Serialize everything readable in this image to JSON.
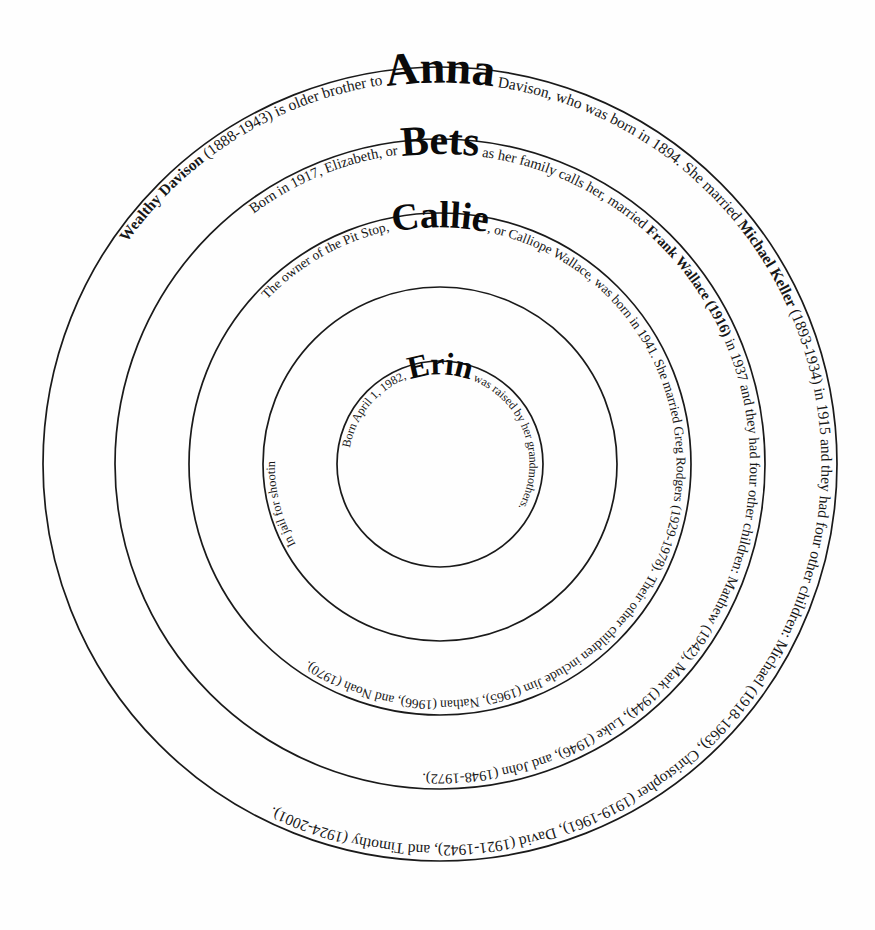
{
  "diagram": {
    "type": "concentric-rings",
    "background_color": "#ffffff",
    "stroke_color": "#1a1a1a",
    "text_color": "#171717"
  },
  "rings": [
    {
      "id": "ring-anna",
      "name": "Anna",
      "generation": 1,
      "radius": 397,
      "name_font_size": 46,
      "body_font_size": 15.5,
      "lead_text": "Wealthy Davison ",
      "lead_text_plain": "(1888-1943) is older brother to ",
      "trail_text": " Davison, who was born in 1894. She married ",
      "trail_bold_1": "Michael Keller",
      "trail_text_2": " (1893-1934) in 1915 and they had four other children: Michael (1918-1963), Christopher (1919-1961), David (1921-1942), and Timothy (1924-2001).",
      "full_text": "Wealthy Davison (1888-1943) is older brother to Anna Davison, who was born in 1894. She married Michael Keller (1893-1934) in 1915 and they had four other children: Michael (1918-1963), Christopher (1919-1961), David (1921-1942), and Timothy (1924-2001)."
    },
    {
      "id": "ring-bets",
      "name": "Bets",
      "generation": 2,
      "radius": 325,
      "name_font_size": 42,
      "body_font_size": 14.5,
      "lead_text_plain": "Born in 1917, Elizabeth, or ",
      "trail_text": " as her family calls her, married ",
      "trail_bold_1": "Frank Wallace (1916)",
      "trail_text_2": " in 1937 and they had four other children: Matthew (1942), Mark (1944), Luke (1946), and John (1948-1972).",
      "full_text": "Born in 1917, Elizabeth, or Bets as her family calls her, married Frank Wallace (1916) in 1937 and they had four other children: Matthew (1942), Mark (1944), Luke (1946), and John (1948-1972)."
    },
    {
      "id": "ring-callie",
      "name": "Callie",
      "generation": 3,
      "radius": 251,
      "name_font_size": 38,
      "body_font_size": 13.5,
      "lead_text_plain": "The owner of the Pit Stop, ",
      "trail_text": ", or Calliope Wallace, was born in 1941. She married Greg Rodgers (1929-1978). Their other children include Jim (1965), Nathan (1966), and Noah (1970).",
      "full_text": "The owner of the Pit Stop, Callie, or Calliope Wallace, was born in 1941. She married Greg Rodgers (1929-1978). Their other children include Jim (1965), Nathan (1966), and Noah (1970)."
    },
    {
      "id": "ring-deb",
      "name": "Deb",
      "generation": 4,
      "radius": 177,
      "name_font_size": 35,
      "body_font_size": 12.5,
      "lead_text_plain": "Carl Ripplinger (1956-1986), her husband, ",
      "trail_text": ", or Deborah Rodgers, was born in 1964. She married Carl in 1982.",
      "tail_text": "In jail for shooting ",
      "full_text": "In jail for shooting Carl Ripplinger (1956-1986), her husband, Deb, or Deborah Rodgers, was born in 1964. She married Carl in 1982."
    },
    {
      "id": "ring-erin",
      "name": "Erin",
      "generation": 5,
      "radius": 103,
      "name_font_size": 32,
      "body_font_size": 12,
      "lead_text_plain": "Born April 1, 1982, ",
      "trail_text": " was raised by her grandmothers.",
      "full_text": "Born April 1, 1982, Erin was raised by her grandmothers."
    }
  ],
  "center": {
    "cx": 440,
    "cy": 464
  }
}
